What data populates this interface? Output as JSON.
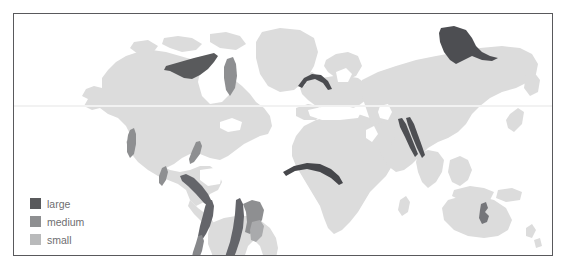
{
  "figure": {
    "type": "world-map-thematic",
    "width": 567,
    "height": 270,
    "background_color": "#ffffff",
    "frame": {
      "border_color": "#59595c",
      "border_width_px": 1,
      "x": 13,
      "y": 13,
      "width": 540,
      "height": 243
    }
  },
  "map": {
    "projection_hint": "equirectangular",
    "land_color": "#dcdcdc",
    "ocean_color": "#ffffff",
    "graticule": {
      "visible": true,
      "color": "#f2f2f2",
      "lines": [
        "equator-like horizontal line"
      ]
    }
  },
  "legend": {
    "position": "bottom-left",
    "items": [
      {
        "label": "large",
        "color": "#595a5c",
        "rank": 1
      },
      {
        "label": "medium",
        "color": "#8e8f91",
        "rank": 2
      },
      {
        "label": "small",
        "color": "#b9babb",
        "rank": 3
      }
    ]
  },
  "regions": [
    {
      "name": "northern-canada",
      "size": "large",
      "color": "#595a5c"
    },
    {
      "name": "greenland-west-coast",
      "size": "medium",
      "color": "#8e8f91"
    },
    {
      "name": "western-united-states",
      "size": "medium",
      "color": "#8e8f91"
    },
    {
      "name": "appalachians",
      "size": "medium",
      "color": "#8e8f91"
    },
    {
      "name": "mexico-highlands",
      "size": "medium",
      "color": "#8e8f91"
    },
    {
      "name": "central-america",
      "size": "large",
      "color": "#64656a"
    },
    {
      "name": "northern-andes",
      "size": "large",
      "color": "#64656a"
    },
    {
      "name": "central-andes",
      "size": "medium",
      "color": "#87888b"
    },
    {
      "name": "brazilian-highlands",
      "size": "large",
      "color": "#64656a"
    },
    {
      "name": "southeast-brazil",
      "size": "medium",
      "color": "#8e8f91"
    },
    {
      "name": "eastern-brazil-patch",
      "size": "small",
      "color": "#a9aaac"
    },
    {
      "name": "alps-europe",
      "size": "large",
      "color": "#4b4c50"
    },
    {
      "name": "west-central-africa",
      "size": "large",
      "color": "#46474b"
    },
    {
      "name": "himalayas-outer",
      "size": "large",
      "color": "#4e4f53"
    },
    {
      "name": "himalayas-inner",
      "size": "large",
      "color": "#4e4f53"
    },
    {
      "name": "siberia",
      "size": "large",
      "color": "#4d4e52"
    },
    {
      "name": "southeast-australia",
      "size": "medium",
      "color": "#75767a"
    }
  ]
}
